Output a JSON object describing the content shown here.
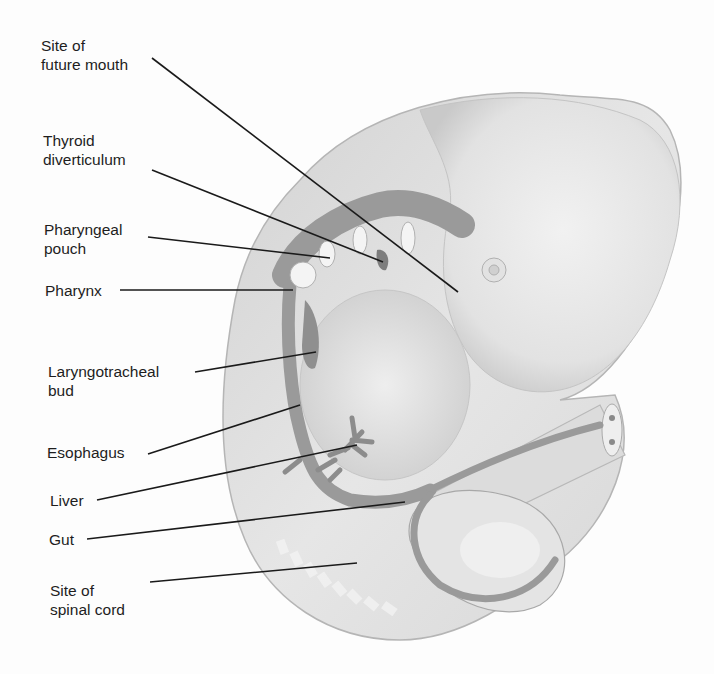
{
  "diagram": {
    "labels": [
      {
        "id": "mouth",
        "text": "Site of\nfuture mouth"
      },
      {
        "id": "thyroid",
        "text": "Thyroid\ndiverticulum"
      },
      {
        "id": "pouch",
        "text": "Pharyngeal\npouch"
      },
      {
        "id": "pharynx",
        "text": "Pharynx"
      },
      {
        "id": "laryngo",
        "text": "Laryngotracheal\nbud"
      },
      {
        "id": "esophagus",
        "text": "Esophagus"
      },
      {
        "id": "liver",
        "text": "Liver"
      },
      {
        "id": "gut",
        "text": "Gut"
      },
      {
        "id": "spinal",
        "text": "Site of\nspinal cord"
      }
    ],
    "colors": {
      "body": "#e6e6e6",
      "body_shade": "#cfcfcf",
      "organ": "#9a9a9a",
      "leader": "#1a1a1a",
      "text": "#1e1e1e"
    }
  }
}
